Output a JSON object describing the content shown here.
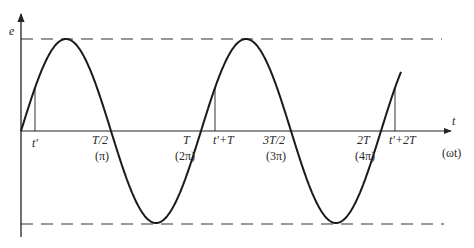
{
  "diagram": {
    "type": "sinusoid-waveform",
    "axes": {
      "y_label": "e",
      "x_label": "t",
      "x_alt_label": "(ωt)"
    },
    "amplitude_lines": {
      "style": "dashed",
      "levels": [
        "+max",
        "-max"
      ]
    },
    "ticks": [
      {
        "id": "t_prime",
        "label": "t′",
        "sub": ""
      },
      {
        "id": "half_T",
        "label": "T/2",
        "sub": "(π)"
      },
      {
        "id": "T",
        "label": "T",
        "sub": "(2π)"
      },
      {
        "id": "t_prime_T",
        "label": "t′+T",
        "sub": ""
      },
      {
        "id": "three_half_T",
        "label": "3T/2",
        "sub": "(3π)"
      },
      {
        "id": "two_T",
        "label": "2T",
        "sub": "(4π)"
      },
      {
        "id": "t_prime_2T",
        "label": "t′+2T",
        "sub": ""
      }
    ],
    "markers": [
      {
        "at": "t′",
        "desc": "vertical line from axis to curve"
      },
      {
        "at": "t′+T",
        "desc": "vertical line from axis to curve"
      },
      {
        "at": "t′+2T",
        "desc": "vertical line from axis to curve"
      }
    ],
    "curve": {
      "function": "e = Em·sin(ωt)",
      "periods_shown": "just over 2"
    }
  }
}
